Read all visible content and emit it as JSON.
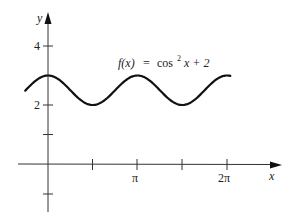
{
  "chart_data": {
    "type": "line",
    "function": "cos^2(x) + 2",
    "xlabel": "x",
    "ylabel": "y",
    "x_tick_labels": [
      "π",
      "2π"
    ],
    "x_ticks": [
      1.5708,
      3.1416,
      4.7124,
      6.2832
    ],
    "y_tick_labels": [
      "4",
      "2"
    ],
    "y_ticks": [
      -1,
      1,
      2,
      3,
      4
    ],
    "xlim": [
      -1.0,
      8.0
    ],
    "ylim": [
      -2.0,
      5.0
    ],
    "plot_range": [
      -0.8,
      6.4
    ],
    "grid": false,
    "legend": "none",
    "series": [
      {
        "name": "f(x) = cos² x + 2",
        "x": [
          -0.8,
          0,
          0.785,
          1.571,
          2.356,
          3.142,
          3.927,
          4.712,
          5.498,
          6.283,
          6.4
        ],
        "values": [
          2.485,
          3.0,
          2.5,
          2.0,
          2.5,
          3.0,
          2.5,
          2.0,
          2.5,
          3.0,
          2.986
        ]
      }
    ]
  },
  "labels": {
    "y_axis": "y",
    "x_axis": "x",
    "tick_4": "4",
    "tick_2": "2",
    "tick_pi": "π",
    "tick_2pi": "2π",
    "formula_fx": "f(x)",
    "formula_eq": "=",
    "formula_cos": "cos",
    "formula_sup": "2",
    "formula_rest": "x + 2"
  }
}
